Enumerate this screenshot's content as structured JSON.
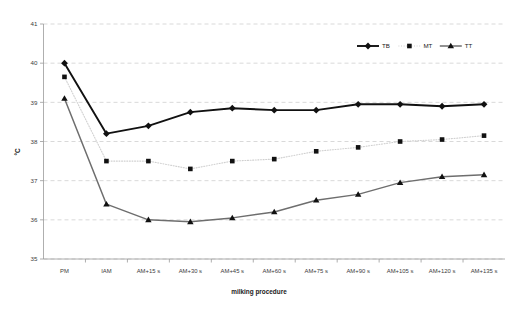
{
  "chart_data": {
    "type": "line",
    "title": "",
    "xlabel": "milking procedure",
    "ylabel": "°C",
    "categories": [
      "PM",
      "IAM",
      "AM+15 s",
      "AM+30 s",
      "AM+45 s",
      "AM+60 s",
      "AM+75 s",
      "AM+90 s",
      "AM+105 s",
      "AM+120 s",
      "AM+135 s"
    ],
    "ylim": [
      35,
      41
    ],
    "yticks": [
      35,
      36,
      37,
      38,
      39,
      40,
      41
    ],
    "ytick_labels": [
      "35",
      "36",
      "37",
      "38",
      "39",
      "40",
      "41"
    ],
    "grid": true,
    "legend_position": "top-right",
    "series": [
      {
        "name": "TB",
        "marker": "diamond",
        "color": "#111111",
        "line_style": "solid",
        "values": [
          40.0,
          38.2,
          38.4,
          38.75,
          38.85,
          38.8,
          38.8,
          38.95,
          38.95,
          38.9,
          38.95
        ]
      },
      {
        "name": "MT",
        "marker": "square",
        "color": "#111111",
        "line_color": "#d0d0d0",
        "line_style": "dotted",
        "values": [
          39.65,
          37.5,
          37.5,
          37.3,
          37.5,
          37.55,
          37.75,
          37.85,
          38.0,
          38.05,
          38.15
        ]
      },
      {
        "name": "TT",
        "marker": "triangle",
        "color": "#111111",
        "line_color": "#6e6e6e",
        "line_style": "solid",
        "values": [
          39.1,
          36.4,
          36.0,
          35.95,
          36.05,
          36.2,
          36.5,
          36.65,
          36.95,
          37.1,
          37.15
        ]
      }
    ]
  },
  "legend": {
    "items": [
      {
        "label": "TB"
      },
      {
        "label": "MT"
      },
      {
        "label": "TT"
      }
    ]
  }
}
